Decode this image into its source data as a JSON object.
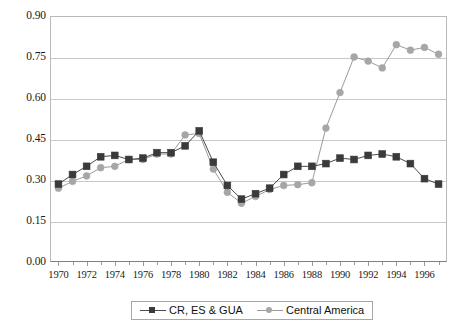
{
  "chart_data": {
    "type": "line",
    "title": "",
    "subtitle": "",
    "xlabel": "",
    "ylabel": "",
    "xlim": [
      1969.4,
      1997.6
    ],
    "ylim": [
      0.0,
      0.9
    ],
    "grid": true,
    "legend_position": "bottom-center",
    "ytick_labels": [
      "0.90",
      "0.75",
      "0.60",
      "0.45",
      "0.30",
      "0.15",
      "0.00"
    ],
    "ytick_values": [
      0.9,
      0.75,
      0.6,
      0.45,
      0.3,
      0.15,
      0.0
    ],
    "xtick_labels": [
      "1970",
      "1972",
      "1974",
      "1976",
      "1978",
      "1980",
      "1982",
      "1984",
      "1986",
      "1988",
      "1990",
      "1992",
      "1994",
      "1996"
    ],
    "xtick_values": [
      1970,
      1972,
      1974,
      1976,
      1978,
      1980,
      1982,
      1984,
      1986,
      1988,
      1990,
      1992,
      1994,
      1996
    ],
    "x": [
      1970,
      1971,
      1972,
      1973,
      1974,
      1975,
      1976,
      1977,
      1978,
      1979,
      1980,
      1981,
      1982,
      1983,
      1984,
      1985,
      1986,
      1987,
      1988,
      1989,
      1990,
      1991,
      1992,
      1993,
      1994,
      1995,
      1996,
      1997
    ],
    "series": [
      {
        "name": "CR, ES & GUA",
        "marker": "square",
        "color": "#3a3a3a",
        "line_color": "#4a4a4a",
        "values": [
          0.285,
          0.32,
          0.35,
          0.385,
          0.39,
          0.375,
          0.38,
          0.4,
          0.4,
          0.425,
          0.48,
          0.365,
          0.28,
          0.23,
          0.25,
          0.27,
          0.32,
          0.35,
          0.35,
          0.36,
          0.38,
          0.375,
          0.39,
          0.395,
          0.385,
          0.36,
          0.305,
          0.285
        ]
      },
      {
        "name": "Central America",
        "marker": "circle",
        "color": "#a6a6a6",
        "line_color": "#9b9b9b",
        "values": [
          0.27,
          0.295,
          0.315,
          0.345,
          0.35,
          0.375,
          0.375,
          0.395,
          0.395,
          0.465,
          0.47,
          0.34,
          0.255,
          0.215,
          0.24,
          0.265,
          0.28,
          0.283,
          0.29,
          0.49,
          0.62,
          0.75,
          0.735,
          0.71,
          0.795,
          0.775,
          0.785,
          0.76
        ]
      }
    ]
  },
  "legend": {
    "entries": [
      {
        "label": "CR, ES & GUA",
        "marker": "square-marker-icon"
      },
      {
        "label": "Central America",
        "marker": "circle-marker-icon"
      }
    ]
  },
  "colors": {
    "series_dark": "#3a3a3a",
    "series_gray": "#a6a6a6",
    "gridline": "#c8c8c8",
    "axis": "#808080",
    "background": "#ffffff",
    "text": "#1a1a1a"
  }
}
